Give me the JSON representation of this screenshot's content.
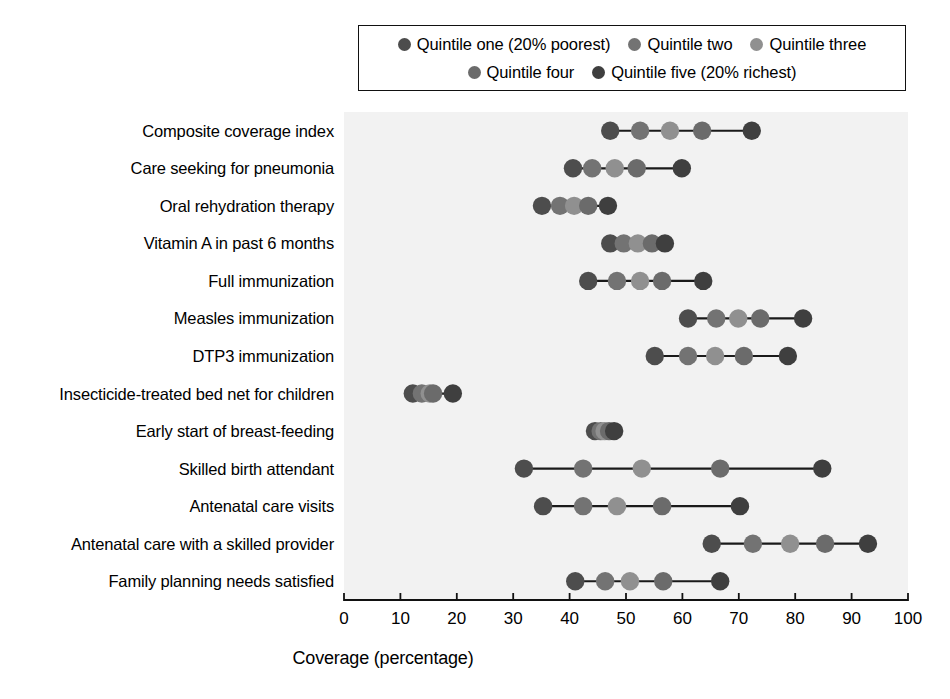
{
  "chart_data": {
    "type": "scatter",
    "title": "",
    "subtitle": "",
    "xlabel": "Coverage (percentage)",
    "ylabel": "",
    "xlim": [
      0,
      100
    ],
    "xticks": [
      0,
      10,
      20,
      30,
      40,
      50,
      60,
      70,
      80,
      90,
      100
    ],
    "xtick_labels": [
      "0",
      "10",
      "20",
      "30",
      "40",
      "50",
      "60",
      "70",
      "80",
      "90",
      "100"
    ],
    "grid": false,
    "legend_position": "top",
    "plot_background": "#f2f2f2",
    "connector_color": "#1a1a1a",
    "series": [
      {
        "name": "Quintile one (20% poorest)",
        "color": "#4d4d4d"
      },
      {
        "name": "Quintile two",
        "color": "#737373"
      },
      {
        "name": "Quintile three",
        "color": "#909090"
      },
      {
        "name": "Quintile four",
        "color": "#6b6b6b"
      },
      {
        "name": "Quintile five (20% richest)",
        "color": "#3f3f3f"
      }
    ],
    "categories": [
      "Composite coverage index",
      "Care seeking for pneumonia",
      "Oral rehydration therapy",
      "Vitamin A in past 6 months",
      "Full immunization",
      "Measles immunization",
      "DTP3 immunization",
      "Insecticide-treated bed net for children",
      "Early start of breast-feeding",
      "Skilled birth attendant",
      "Antenatal care visits",
      "Antenatal care with a skilled provider",
      "Family planning needs satisfied"
    ],
    "rows": [
      {
        "category": "Composite coverage index",
        "values": [
          47.2,
          52.5,
          57.8,
          63.5,
          72.3
        ]
      },
      {
        "category": "Care seeking for pneumonia",
        "values": [
          40.6,
          44.0,
          48.0,
          51.9,
          59.9
        ]
      },
      {
        "category": "Oral rehydration therapy",
        "values": [
          35.1,
          38.3,
          40.8,
          43.3,
          46.8
        ]
      },
      {
        "category": "Vitamin A in past 6 months",
        "values": [
          47.2,
          49.6,
          52.1,
          54.6,
          56.9
        ]
      },
      {
        "category": "Full immunization",
        "values": [
          43.3,
          48.4,
          52.5,
          56.4,
          63.7
        ]
      },
      {
        "category": "Measles immunization",
        "values": [
          61.0,
          66.0,
          69.9,
          73.8,
          81.4
        ]
      },
      {
        "category": "DTP3 immunization",
        "values": [
          55.1,
          61.0,
          65.8,
          70.9,
          78.7
        ]
      },
      {
        "category": "Insecticide-treated bed net for children",
        "values": [
          12.2,
          13.8,
          15.2,
          15.8,
          19.3
        ]
      },
      {
        "category": "Early start of breast-feeding",
        "values": [
          44.5,
          45.5,
          46.2,
          47.0,
          47.9
        ]
      },
      {
        "category": "Skilled birth attendant",
        "values": [
          31.9,
          42.4,
          52.8,
          66.7,
          84.8
        ]
      },
      {
        "category": "Antenatal care visits",
        "values": [
          35.3,
          42.4,
          48.4,
          56.4,
          70.2
        ]
      },
      {
        "category": "Antenatal care with a skilled provider",
        "values": [
          65.2,
          72.5,
          79.1,
          85.3,
          92.9
        ]
      },
      {
        "category": "Family planning needs satisfied",
        "values": [
          41.0,
          46.3,
          50.7,
          56.6,
          66.7
        ]
      }
    ]
  },
  "legend": {
    "rows": [
      [
        {
          "label": "Quintile one (20% poorest)",
          "color": "#4d4d4d"
        },
        {
          "label": "Quintile two",
          "color": "#737373"
        },
        {
          "label": "Quintile three",
          "color": "#909090"
        }
      ],
      [
        {
          "label": "Quintile four",
          "color": "#6b6b6b"
        },
        {
          "label": "Quintile five (20% richest)",
          "color": "#3f3f3f"
        }
      ]
    ]
  },
  "axis": {
    "x_title": "Coverage (percentage)"
  }
}
